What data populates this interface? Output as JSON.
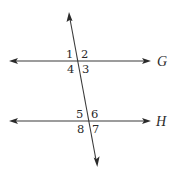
{
  "diagram": {
    "type": "parallel-lines-cut-by-transversal",
    "lines": [
      {
        "id": "line-g",
        "label": "G",
        "x1": 10,
        "y1": 61,
        "x2": 150,
        "y2": 61
      },
      {
        "id": "line-h",
        "label": "H",
        "x1": 10,
        "y1": 121,
        "x2": 150,
        "y2": 121
      }
    ],
    "transversal": {
      "x1": 69,
      "y1": 13,
      "x2": 97,
      "y2": 166
    },
    "angle_labels": [
      {
        "id": "angle-1",
        "text": "1",
        "x": 66,
        "y": 58
      },
      {
        "id": "angle-2",
        "text": "2",
        "x": 81,
        "y": 58
      },
      {
        "id": "angle-4",
        "text": "4",
        "x": 67,
        "y": 73
      },
      {
        "id": "angle-3",
        "text": "3",
        "x": 82,
        "y": 73
      },
      {
        "id": "angle-5",
        "text": "5",
        "x": 76,
        "y": 118
      },
      {
        "id": "angle-6",
        "text": "6",
        "x": 91,
        "y": 118
      },
      {
        "id": "angle-8",
        "text": "8",
        "x": 77,
        "y": 133
      },
      {
        "id": "angle-7",
        "text": "7",
        "x": 92,
        "y": 133
      }
    ],
    "line_labels": [
      {
        "id": "label-g",
        "text": "G",
        "x": 157,
        "y": 66
      },
      {
        "id": "label-h",
        "text": "H",
        "x": 157,
        "y": 126
      }
    ],
    "colors": {
      "stroke": "#3a3a3a",
      "text": "#2a2a2a",
      "background": "#ffffff"
    }
  }
}
